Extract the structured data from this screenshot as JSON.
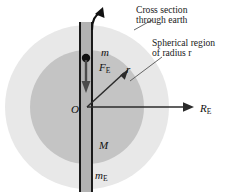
{
  "figure": {
    "background_color": "#ffffff"
  },
  "callouts": [
    {
      "name": "cross-section-callout",
      "line1": "Cross section",
      "line2": "through earth"
    },
    {
      "name": "spherical-region-callout",
      "line1": "Spherical region",
      "line2": "of radius r"
    }
  ],
  "labels": {
    "mass_particle": "m",
    "force": "F",
    "force_sub": "E",
    "radius_inner": "r",
    "center": "O",
    "earth_radius": "R",
    "earth_radius_sub": "E",
    "enclosed_mass": "M",
    "earth_mass": "m",
    "earth_mass_sub": "E"
  },
  "colors": {
    "outer_sphere_fill": "#e8e8e8",
    "inner_sphere_fill": "#c4c4c4",
    "tunnel_fill": "#b0b0b0",
    "stroke": "#1a1a1a",
    "leader_line": "#555555",
    "text": "#111111"
  },
  "geometry": {
    "center_x": 87,
    "center_y": 107,
    "outer_radius": 82,
    "inner_radius": 57,
    "tunnel_left_x": 79,
    "tunnel_right_x": 93
  }
}
